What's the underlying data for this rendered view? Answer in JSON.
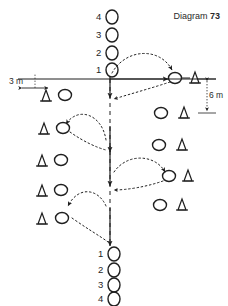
{
  "page": {
    "title_prefix": "Diagram",
    "title_number": "73",
    "background": "#ffffff",
    "ink": "#1f1f1f",
    "width": 228,
    "height": 306
  },
  "annotations": {
    "horizontal_distance": "3 m",
    "vertical_distance": "6 m"
  },
  "top_sequence": {
    "caption": "players queued above the start line, numbered top-down",
    "labels": [
      "4",
      "3",
      "2",
      "1"
    ]
  },
  "bottom_sequence": {
    "caption": "players queued below the finish line, numbered top-down",
    "labels": [
      "1",
      "2",
      "3",
      "4"
    ]
  },
  "legend_items": [
    {
      "name": "ball",
      "glyph": "circle"
    },
    {
      "name": "cone",
      "glyph": "triangle"
    }
  ],
  "left_column": {
    "caption": "cone followed by ball, five rows",
    "rows": [
      {
        "cone": "cone",
        "ball": "ball"
      },
      {
        "cone": "cone",
        "ball": "ball"
      },
      {
        "cone": "cone",
        "ball": "ball"
      },
      {
        "cone": "cone",
        "ball": "ball"
      },
      {
        "cone": "cone",
        "ball": "ball"
      }
    ]
  },
  "right_column": {
    "caption": "ball followed by cone, five rows",
    "rows": [
      {
        "ball": "ball",
        "cone": "cone"
      },
      {
        "ball": "ball",
        "cone": "cone"
      },
      {
        "ball": "ball",
        "cone": "cone"
      },
      {
        "ball": "ball",
        "cone": "cone"
      },
      {
        "ball": "ball",
        "cone": "cone"
      }
    ]
  },
  "paths": {
    "centre_run": "dashed vertical run down the middle with solid arrow segments",
    "passes": [
      {
        "from": "centre line row 1",
        "to": "right ball row 1",
        "style": "dotted arc"
      },
      {
        "from": "right ball row 1",
        "to": "centre line row 2",
        "style": "dotted return"
      },
      {
        "from": "centre line row 2",
        "to": "left ball row 2",
        "style": "dotted arc"
      },
      {
        "from": "left ball row 2",
        "to": "centre line row 3",
        "style": "dotted return"
      },
      {
        "from": "centre line row 3",
        "to": "right ball row 4",
        "style": "dotted arc"
      },
      {
        "from": "right ball row 4",
        "to": "centre line row 4",
        "style": "dotted return"
      },
      {
        "from": "centre line row 4",
        "to": "left ball row 5",
        "style": "dotted arc"
      },
      {
        "from": "left ball row 5",
        "to": "centre finish",
        "style": "dotted return"
      }
    ]
  }
}
